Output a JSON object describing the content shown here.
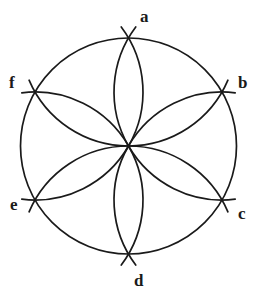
{
  "figure": {
    "type": "geometric-construction",
    "background_color": "#ffffff",
    "stroke_color": "#1a1a1a",
    "circle": {
      "center_x": 128.5,
      "center_y": 146,
      "radius": 108,
      "stroke_width": 1.7
    },
    "arc_stroke_width": 1.7,
    "arc_overshoot_degrees": 7,
    "vertices": [
      {
        "id": "a",
        "label": "a",
        "angle_deg": -90,
        "x": 128.5,
        "y": 38,
        "label_x": 140,
        "label_y": 8
      },
      {
        "id": "b",
        "label": "b",
        "angle_deg": -30,
        "x": 222.0,
        "y": 92,
        "label_x": 238,
        "label_y": 74
      },
      {
        "id": "c",
        "label": "c",
        "angle_deg": 30,
        "x": 222.0,
        "y": 200,
        "label_x": 238,
        "label_y": 205
      },
      {
        "id": "d",
        "label": "d",
        "angle_deg": 90,
        "x": 128.5,
        "y": 254,
        "label_x": 134,
        "label_y": 272
      },
      {
        "id": "e",
        "label": "e",
        "angle_deg": 150,
        "x": 35.0,
        "y": 200,
        "label_x": 10,
        "label_y": 196
      },
      {
        "id": "f",
        "label": "f",
        "angle_deg": -150,
        "x": 35.0,
        "y": 92,
        "label_x": 9,
        "label_y": 74
      }
    ]
  }
}
